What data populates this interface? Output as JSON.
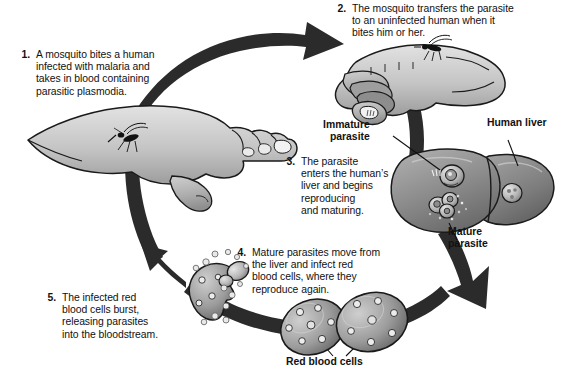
{
  "diagram": {
    "type": "cycle-diagram",
    "palette": {
      "background": "#ffffff",
      "ink": "#111111",
      "arrow_dark": "#2b2b2b",
      "skin_light": "#d9d9d9",
      "skin_mid": "#b3b3b3",
      "skin_shadow": "#8a8a8a",
      "liver_mid": "#9a9a9a",
      "liver_dark": "#6e6e6e",
      "cell_mid": "#a6a6a6",
      "cell_dark": "#4f4f4f",
      "outline": "#1a1a1a"
    },
    "steps": [
      {
        "number": "1.",
        "lines": [
          "A mosquito bites a human",
          "infected with malaria and",
          "takes in blood containing",
          "parasitic plasmodia."
        ]
      },
      {
        "number": "2.",
        "lines": [
          "The mosquito transfers the parasite",
          "to an uninfected human when it",
          "bites him or her."
        ]
      },
      {
        "number": "3.",
        "lines": [
          "The parasite",
          "enters the human’s",
          "liver and begins",
          "reproducing",
          "and maturing."
        ]
      },
      {
        "number": "4.",
        "lines": [
          "Mature parasites move from",
          "the liver and infect red",
          "blood cells, where they",
          "reproduce again."
        ]
      },
      {
        "number": "5.",
        "lines": [
          "The infected red",
          "blood cells burst,",
          "releasing parasites",
          "into the bloodstream."
        ]
      }
    ],
    "callouts": [
      {
        "id": "immature-parasite",
        "lines": [
          "Immature",
          "parasite"
        ]
      },
      {
        "id": "human-liver",
        "lines": [
          "Human liver"
        ]
      },
      {
        "id": "mature-parasite",
        "lines": [
          "Mature",
          "parasite"
        ]
      },
      {
        "id": "red-blood-cells",
        "lines": [
          "Red blood cells"
        ]
      }
    ],
    "illustration_elements": [
      "cycle-arrow-top",
      "cycle-arrow-right",
      "cycle-arrow-bottom",
      "cycle-arrow-left",
      "hand-infected-with-mosquito",
      "hand-uninfected-with-mosquito",
      "human-liver-organ",
      "red-blood-cells-pair",
      "bursting-red-blood-cell",
      "released-parasites"
    ]
  }
}
